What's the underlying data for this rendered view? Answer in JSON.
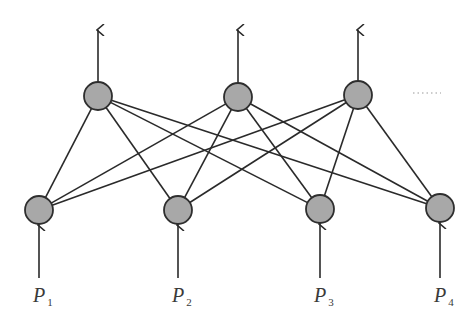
{
  "diagram": {
    "title": "",
    "type": "neural-network",
    "layers": [
      {
        "name": "input",
        "node_count": 4,
        "node_color": "#a8a8a8"
      },
      {
        "name": "output",
        "node_count": 3,
        "node_color": "#a8a8a8",
        "continues": true
      }
    ],
    "connectivity": "fully-connected",
    "inputs": [
      {
        "symbol": "P",
        "subscript": "1"
      },
      {
        "symbol": "P",
        "subscript": "2"
      },
      {
        "symbol": "P",
        "subscript": "3"
      },
      {
        "symbol": "P",
        "subscript": "4"
      }
    ],
    "continuation_mark": "......",
    "colors": {
      "node_fill": "#a8a8a8",
      "stroke": "#2a2a2a",
      "background": "#ffffff"
    }
  }
}
